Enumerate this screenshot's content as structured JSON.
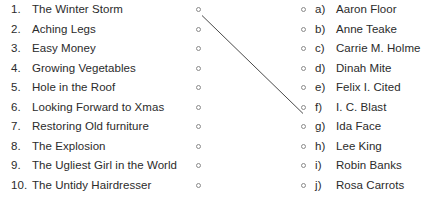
{
  "exercise": {
    "left_column": {
      "items": [
        {
          "marker": "1.",
          "label": "The Winter Storm",
          "node": "match-node"
        },
        {
          "marker": "2.",
          "label": "Aching Legs",
          "node": "match-node"
        },
        {
          "marker": "3.",
          "label": "Easy Money",
          "node": "match-node"
        },
        {
          "marker": "4.",
          "label": "Growing Vegetables",
          "node": "match-node"
        },
        {
          "marker": "5.",
          "label": "Hole in the Roof",
          "node": "match-node"
        },
        {
          "marker": "6.",
          "label": "Looking Forward to Xmas",
          "node": "match-node"
        },
        {
          "marker": "7.",
          "label": "Restoring Old furniture",
          "node": "match-node"
        },
        {
          "marker": "8.",
          "label": "The Explosion",
          "node": "match-node"
        },
        {
          "marker": "9.",
          "label": "The Ugliest Girl in the World",
          "node": "match-node"
        },
        {
          "marker": "10.",
          "label": "The Untidy Hairdresser",
          "node": "match-node"
        }
      ]
    },
    "right_column": {
      "items": [
        {
          "marker": "a)",
          "label": "Aaron Floor",
          "node": "match-node"
        },
        {
          "marker": "b)",
          "label": "Anne Teake",
          "node": "match-node"
        },
        {
          "marker": "c)",
          "label": "Carrie M. Holme",
          "node": "match-node"
        },
        {
          "marker": "d)",
          "label": "Dinah Mite",
          "node": "match-node"
        },
        {
          "marker": "e)",
          "label": "Felix I. Cited",
          "node": "match-node"
        },
        {
          "marker": "f)",
          "label": "I. C. Blast",
          "node": "match-node"
        },
        {
          "marker": "g)",
          "label": "Ida Face",
          "node": "match-node"
        },
        {
          "marker": "h)",
          "label": "Lee King",
          "node": "match-node"
        },
        {
          "marker": "i)",
          "label": "Robin Banks",
          "node": "match-node"
        },
        {
          "marker": "j)",
          "label": "Rosa Carrots",
          "node": "match-node"
        }
      ]
    },
    "connections": [
      {
        "from_marker": "1.",
        "to_marker": "f)",
        "x1": 202,
        "y1": 15.5,
        "x2": 303,
        "y2": 113.5
      }
    ],
    "colors": {
      "text": "#2b2b2b",
      "node_stroke": "#8a8a8a",
      "connector_line": "#4a4a4a",
      "background": "#ffffff"
    }
  }
}
